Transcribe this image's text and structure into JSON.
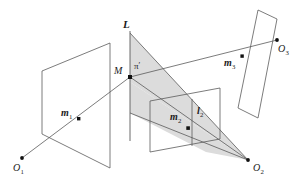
{
  "figure": {
    "type": "geometry-diagram",
    "background_color": "#ffffff",
    "stroke_color": "#4a4a4a",
    "shade_color": "#d9d9d9",
    "point_color": "#111111",
    "labels": {
      "line_L": "L",
      "point_M": "M",
      "plane_pi_prime": "π",
      "plane_pi_prime_mark": "′",
      "image_point_1": "m",
      "image_point_1_sub": "1",
      "image_point_2": "m",
      "image_point_2_sub": "2",
      "image_point_3": "m",
      "image_point_3_sub": "3",
      "image_line_2": "l",
      "image_line_2_sub": "2",
      "camera_1": "O",
      "camera_1_sub": "1",
      "camera_2": "O",
      "camera_2_sub": "2",
      "camera_3": "O",
      "camera_3_sub": "3"
    },
    "geometry": {
      "plane1_points": "42,71 110,43 110,168 42,134",
      "plane2_points": "150,101 220,88 220,139 150,152",
      "plane3_points": "258,10 277,18 258,118 238,110",
      "line_L": {
        "x1": 130,
        "y1": 31,
        "x2": 130,
        "y2": 141
      },
      "pi_prime_shade": "130,33 248,160 130,82",
      "pi_prime_band": "130,82 248,160 197,149 130,113",
      "camera1": {
        "x": 22,
        "y": 158
      },
      "camera2": {
        "x": 248,
        "y": 160
      },
      "camera3": {
        "x": 277,
        "y": 40
      },
      "pointM": {
        "x": 130,
        "y": 77
      },
      "m1": {
        "x": 79,
        "y": 119
      },
      "m2": {
        "x": 188,
        "y": 128
      },
      "m3": {
        "x": 242,
        "y": 56
      }
    }
  }
}
